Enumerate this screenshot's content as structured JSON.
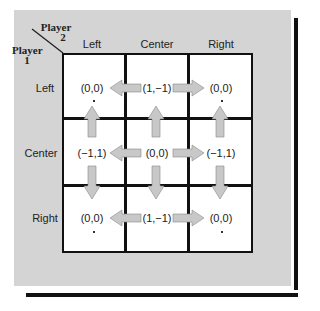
{
  "header": {
    "player2_label": "Player",
    "player2_num": "2",
    "player1_label": "Player",
    "player1_num": "1"
  },
  "columns": [
    "Left",
    "Center",
    "Right"
  ],
  "rows": [
    "Left",
    "Center",
    "Right"
  ],
  "payoffs": [
    [
      "(0,0)",
      "(1,−1)",
      "(0,0)"
    ],
    [
      "(−1,1)",
      "(0,0)",
      "(−1,1)"
    ],
    [
      "(0,0)",
      "(1,−1)",
      "(0,0)"
    ]
  ],
  "arrows": [
    {
      "from": "row1-center",
      "to": "row1-left",
      "direction": "left"
    },
    {
      "from": "row1-center",
      "to": "row1-right",
      "direction": "right"
    },
    {
      "from": "row2-center",
      "to": "row2-left",
      "direction": "left"
    },
    {
      "from": "row2-center",
      "to": "row2-right",
      "direction": "right"
    },
    {
      "from": "row3-center",
      "to": "row3-left",
      "direction": "left"
    },
    {
      "from": "row3-center",
      "to": "row3-right",
      "direction": "right"
    },
    {
      "from": "row2-left",
      "to": "row1-left",
      "direction": "up"
    },
    {
      "from": "row2-left",
      "to": "row3-left",
      "direction": "down"
    },
    {
      "from": "row2-center",
      "to": "row1-center",
      "direction": "up"
    },
    {
      "from": "row2-center",
      "to": "row3-center",
      "direction": "down"
    },
    {
      "from": "row2-right",
      "to": "row1-right",
      "direction": "up"
    },
    {
      "from": "row2-right",
      "to": "row3-right",
      "direction": "down"
    }
  ],
  "equilibrium_markers": [
    "row1-left",
    "row1-right",
    "row3-left",
    "row3-right"
  ],
  "colors": {
    "panel": "#d4d4d4",
    "arrow": "#c8c8c8",
    "line": "#111111"
  }
}
